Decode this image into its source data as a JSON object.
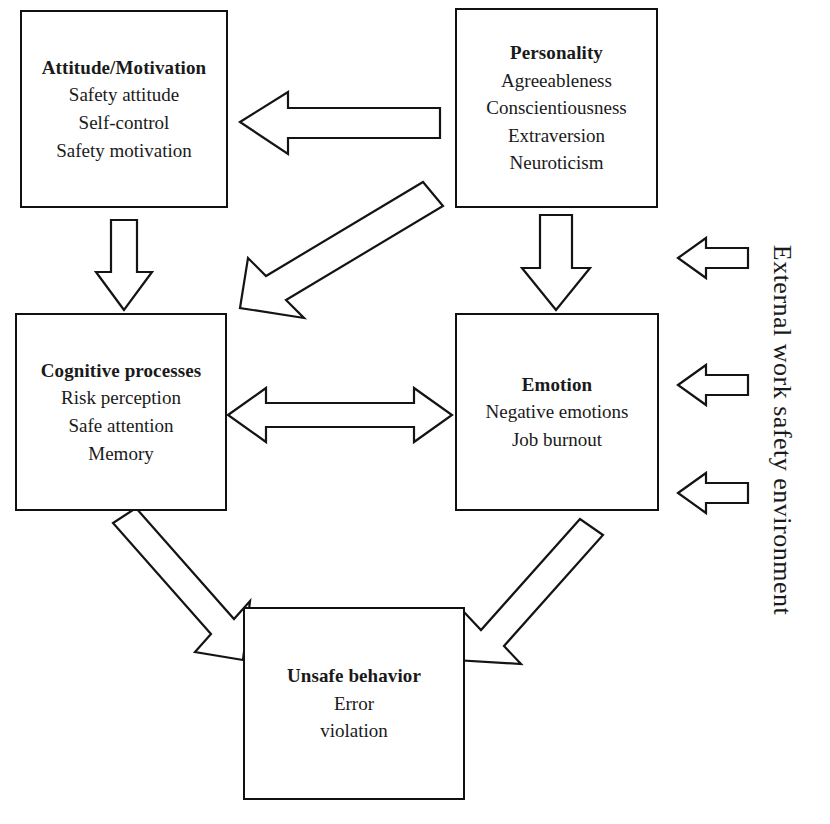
{
  "diagram": {
    "environment_label": "External work safety environment",
    "nodes": [
      {
        "id": "attitude",
        "title": "Attitude/Motivation",
        "items": [
          "Safety attitude",
          "Self-control",
          "Safety motivation"
        ]
      },
      {
        "id": "personality",
        "title": "Personality",
        "items": [
          "Agreeableness",
          "Conscientiousness",
          "Extraversion",
          "Neuroticism"
        ]
      },
      {
        "id": "cognitive",
        "title": "Cognitive processes",
        "items": [
          "Risk perception",
          "Safe attention",
          "Memory"
        ]
      },
      {
        "id": "emotion",
        "title": "Emotion",
        "items": [
          "Negative emotions",
          "Job burnout"
        ]
      },
      {
        "id": "unsafe",
        "title": "Unsafe behavior",
        "items": [
          "Error",
          "violation"
        ]
      }
    ],
    "connectors": [
      {
        "id": "personality-to-attitude",
        "from": "personality",
        "to": "attitude",
        "style": "block-arrow",
        "direction": "left"
      },
      {
        "id": "personality-to-cognitive",
        "from": "personality",
        "to": "cognitive",
        "style": "block-arrow",
        "direction": "down-left"
      },
      {
        "id": "attitude-to-cognitive",
        "from": "attitude",
        "to": "cognitive",
        "style": "block-arrow",
        "direction": "down"
      },
      {
        "id": "personality-to-emotion",
        "from": "personality",
        "to": "emotion",
        "style": "block-arrow",
        "direction": "down"
      },
      {
        "id": "cognitive-emotion",
        "from": "cognitive",
        "to": "emotion",
        "style": "block-arrow",
        "direction": "bidirectional"
      },
      {
        "id": "cognitive-to-unsafe",
        "from": "cognitive",
        "to": "unsafe",
        "style": "block-arrow",
        "direction": "down-right"
      },
      {
        "id": "emotion-to-unsafe",
        "from": "emotion",
        "to": "unsafe",
        "style": "block-arrow",
        "direction": "down-left"
      },
      {
        "id": "environment-to-personality",
        "from": "environment",
        "to": "personality",
        "style": "block-arrow",
        "direction": "left"
      },
      {
        "id": "environment-to-emotion",
        "from": "environment",
        "to": "emotion",
        "style": "block-arrow",
        "direction": "left"
      },
      {
        "id": "environment-to-emotion-2",
        "from": "environment",
        "to": "emotion",
        "style": "block-arrow",
        "direction": "left"
      }
    ],
    "colors": {
      "stroke": "#141414",
      "fill": "#ffffff",
      "text": "#1a1a1a"
    }
  }
}
